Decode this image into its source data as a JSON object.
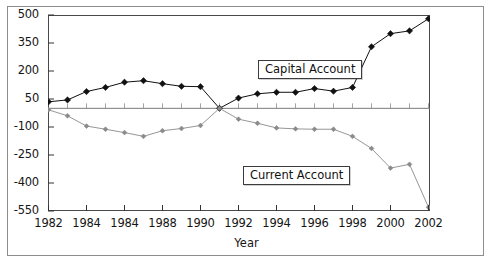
{
  "chart_data": {
    "type": "line",
    "title": "",
    "xlabel": "Year",
    "ylabel": "",
    "grid": false,
    "legend_position": "inline-annotations",
    "xlim": [
      1982,
      2002
    ],
    "ylim": [
      -550,
      500
    ],
    "x": [
      1982,
      1983,
      1984,
      1985,
      1986,
      1987,
      1988,
      1989,
      1990,
      1991,
      1992,
      1993,
      1994,
      1995,
      1996,
      1997,
      1998,
      1999,
      2000,
      2001,
      2002
    ],
    "xtick_labels": [
      "1982",
      "1984",
      "1984",
      "1988",
      "1990",
      "1992",
      "1994",
      "1996",
      "1998",
      "2000",
      "2002"
    ],
    "xtick_values": [
      1982,
      1984,
      1986,
      1988,
      1990,
      1992,
      1994,
      1996,
      1998,
      2000,
      2002
    ],
    "ytick_labels": [
      "500",
      "350",
      "200",
      "50",
      "-100",
      "-250",
      "-400",
      "-550"
    ],
    "ytick_values": [
      500,
      350,
      200,
      50,
      -100,
      -250,
      -400,
      -550
    ],
    "series": [
      {
        "name": "Capital Account",
        "color": "#111111",
        "marker": "diamond",
        "values": [
          35,
          45,
          90,
          112,
          140,
          148,
          132,
          118,
          116,
          0,
          55,
          78,
          86,
          86,
          106,
          92,
          112,
          330,
          400,
          415,
          480
        ]
      },
      {
        "name": "Current Account",
        "color": "#8a8a8a",
        "marker": "diamond",
        "values": [
          -8,
          -40,
          -95,
          -112,
          -130,
          -150,
          -120,
          -108,
          -92,
          0,
          -58,
          -80,
          -105,
          -110,
          -112,
          -112,
          -150,
          -215,
          -320,
          -300,
          -530
        ]
      }
    ],
    "annotations": [
      {
        "text": "Capital Account",
        "x": 1993,
        "y": 230
      },
      {
        "text": "Current Account",
        "x": 1992,
        "y": -300
      }
    ]
  },
  "axis": {
    "x_title": "Year"
  }
}
